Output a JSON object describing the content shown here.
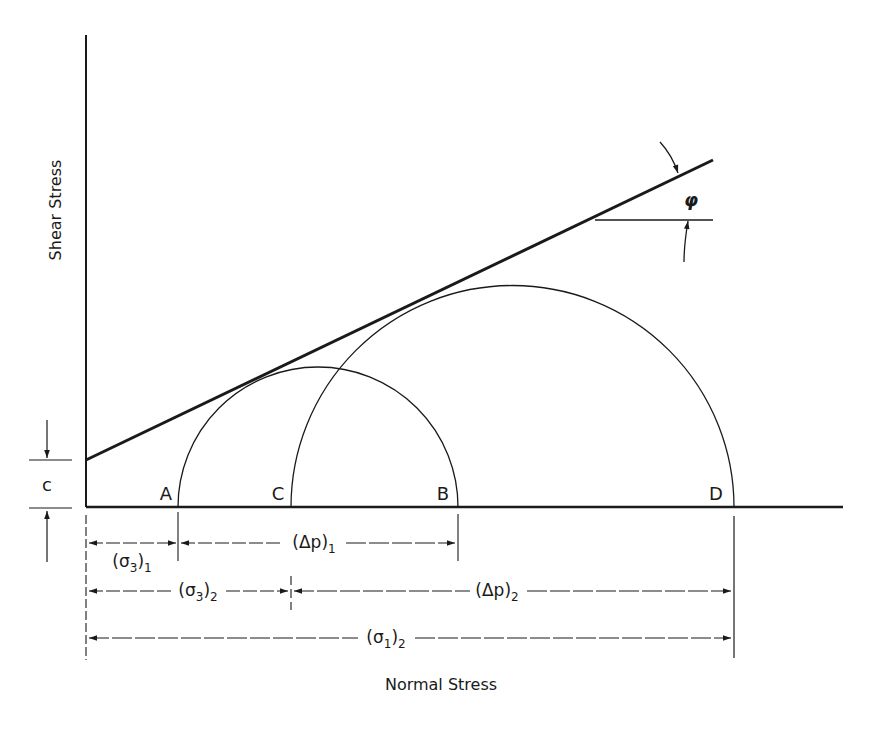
{
  "axes": {
    "y_label": "Shear Stress",
    "x_label": "Normal Stress"
  },
  "envelope": {
    "intercept_label": "c",
    "angle_label": "φ"
  },
  "points": {
    "A": "A",
    "B": "B",
    "C": "C",
    "D": "D"
  },
  "dimensions": {
    "sigma3_1": {
      "main": "(σ",
      "sub1": "3",
      "close": ")",
      "sub2": "1"
    },
    "dp_1": {
      "main": "(Δp)",
      "sub": "1"
    },
    "sigma3_2": {
      "main": "(σ",
      "sub1": "3",
      "close": ")",
      "sub2": "2"
    },
    "dp_2": {
      "main": "(Δp)",
      "sub": "2"
    },
    "sigma1_2": {
      "main": "(σ",
      "sub1": "1",
      "close": ")",
      "sub2": "2"
    }
  },
  "colors": {
    "ink": "#1a1a1a",
    "background": "#ffffff"
  }
}
